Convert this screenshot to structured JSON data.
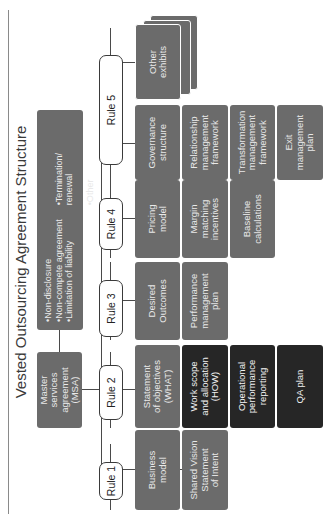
{
  "title": "Vested Outsourcing Agreement Structure",
  "msa": {
    "label": "Master\nservices\nagreement\n(MSA)",
    "bullets_col1": [
      "Non-disclosure",
      "Non-compete agreement",
      "Limitation of liability"
    ],
    "bullets_col2": [
      "Termination/\nrenewal",
      "Other"
    ]
  },
  "rules": [
    {
      "label": "Rule 1"
    },
    {
      "label": "Rule 2"
    },
    {
      "label": "Rule 3"
    },
    {
      "label": "Rule 4"
    },
    {
      "label": "Rule 5"
    }
  ],
  "columns": {
    "business_model": [
      "Business\nmodel",
      "Shared Vision\nStatement\nof Intent"
    ],
    "statement_of_objectives": [
      "Statement\nof objectives\n(WHAT)",
      "Work scope\nand allocation\n(HOW)",
      "Operational\nperformance\nreporting",
      "QA plan"
    ],
    "desired_outcomes": [
      "Desired\nOutcomes",
      "Performance\nmanagement\nplan"
    ],
    "pricing_model": [
      "Pricing\nmodel",
      "Margin\nmatching\nincentives",
      "Baseline\ncalculations"
    ],
    "governance": [
      "Governance\nstructure",
      "Relationship\nmanagement\nframework",
      "Transformation\nmanagement\nframework",
      "Exit\nmanagement\nplan"
    ],
    "other": [
      "Other\nexhibits"
    ]
  },
  "colors": {
    "box_gray": "#6b6b6b",
    "box_black": "#262626",
    "line": "#4a4a4a"
  }
}
